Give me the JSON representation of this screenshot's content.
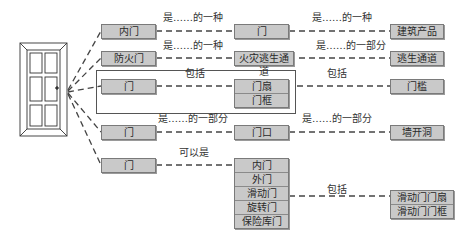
{
  "door": {
    "icon": "door-icon"
  },
  "rows": [
    {
      "left": "内门",
      "relation1": "是……的一种",
      "middle": "门",
      "relation2": "是……的一种",
      "right": "建筑产品"
    },
    {
      "left": "防火门",
      "relation1": "是……的一种",
      "middle": "火灾逃生通道",
      "relation2": "是……的一部分",
      "right": "逃生通道"
    },
    {
      "left": "门",
      "relation1": "包括",
      "middle_stack": [
        "门扇",
        "门框"
      ],
      "relation2": "包括",
      "right": "门槛"
    },
    {
      "left": "门",
      "relation1": "是……的一部分",
      "middle": "门口",
      "relation2": "是……的一部分",
      "right": "墙开洞"
    },
    {
      "left": "门",
      "relation1": "可以是",
      "middle_stack": [
        "内门",
        "外门",
        "滑动门",
        "旋转门",
        "保险库门"
      ],
      "relation2": "包括",
      "right_stack": [
        "滑动门门扇",
        "滑动门门框"
      ]
    }
  ],
  "colors": {
    "box_fill": "#c9c9c9",
    "box_border": "#7a7a7a",
    "line": "#444444"
  }
}
